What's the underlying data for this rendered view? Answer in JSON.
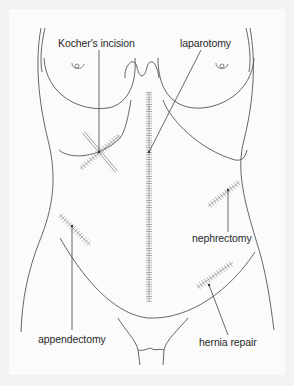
{
  "figure": {
    "type": "anatomical-diagram",
    "colors": {
      "background": "#f3f3f3",
      "panel": "#fbfbfb",
      "outline": "#555555",
      "incision": "#777777",
      "label_text": "#2a2a2a"
    }
  },
  "labels": [
    {
      "id": "kocher",
      "text": "Kocher's incision"
    },
    {
      "id": "laparotomy",
      "text": "laparotomy"
    },
    {
      "id": "nephrectomy",
      "text": "nephrectomy"
    },
    {
      "id": "appendectomy",
      "text": "appendectomy"
    },
    {
      "id": "hernia",
      "text": "hernia repair"
    }
  ]
}
